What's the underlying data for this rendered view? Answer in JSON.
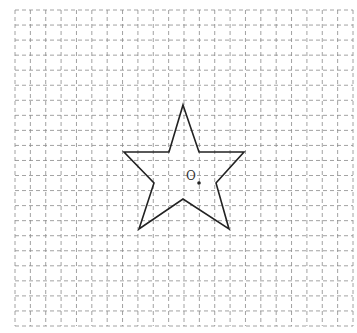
{
  "diagram": {
    "grid": {
      "x0": 15,
      "y0": 10,
      "x1": 353,
      "y1": 326,
      "cols": 22,
      "rows": 21,
      "color": "#8a8a8a"
    },
    "star": {
      "points": [
        [
          183,
          105
        ],
        [
          199,
          152
        ],
        [
          244,
          152
        ],
        [
          216,
          183
        ],
        [
          229,
          229
        ],
        [
          183,
          199
        ],
        [
          139,
          229
        ],
        [
          154,
          183
        ],
        [
          124,
          152
        ],
        [
          169,
          152
        ]
      ],
      "stroke": "#222222"
    },
    "center": {
      "label": "O",
      "x": 199,
      "y": 183,
      "label_x": 186,
      "label_y": 180
    }
  }
}
